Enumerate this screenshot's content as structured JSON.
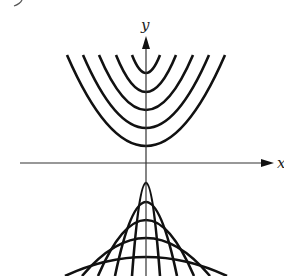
{
  "figure": {
    "axes": {
      "x_label": "x",
      "y_label": "y"
    },
    "origin_px": {
      "x": 146,
      "y": 163
    },
    "upper_family": {
      "opening": "up",
      "vertex_y_px": [
        73,
        92,
        110,
        128,
        146
      ],
      "top_y_px": 55,
      "half_width_at_top_px": [
        14,
        30,
        47,
        63,
        79
      ]
    },
    "lower_family": {
      "opening": "down",
      "vertex_y_px": [
        183,
        202,
        220,
        238,
        257
      ],
      "bottom_y_px": 276,
      "half_width_at_bottom_px": [
        14,
        31,
        48,
        64,
        81
      ]
    },
    "colors": {
      "curve": "#111111",
      "axis": "#333333",
      "background": "#ffffff"
    }
  }
}
